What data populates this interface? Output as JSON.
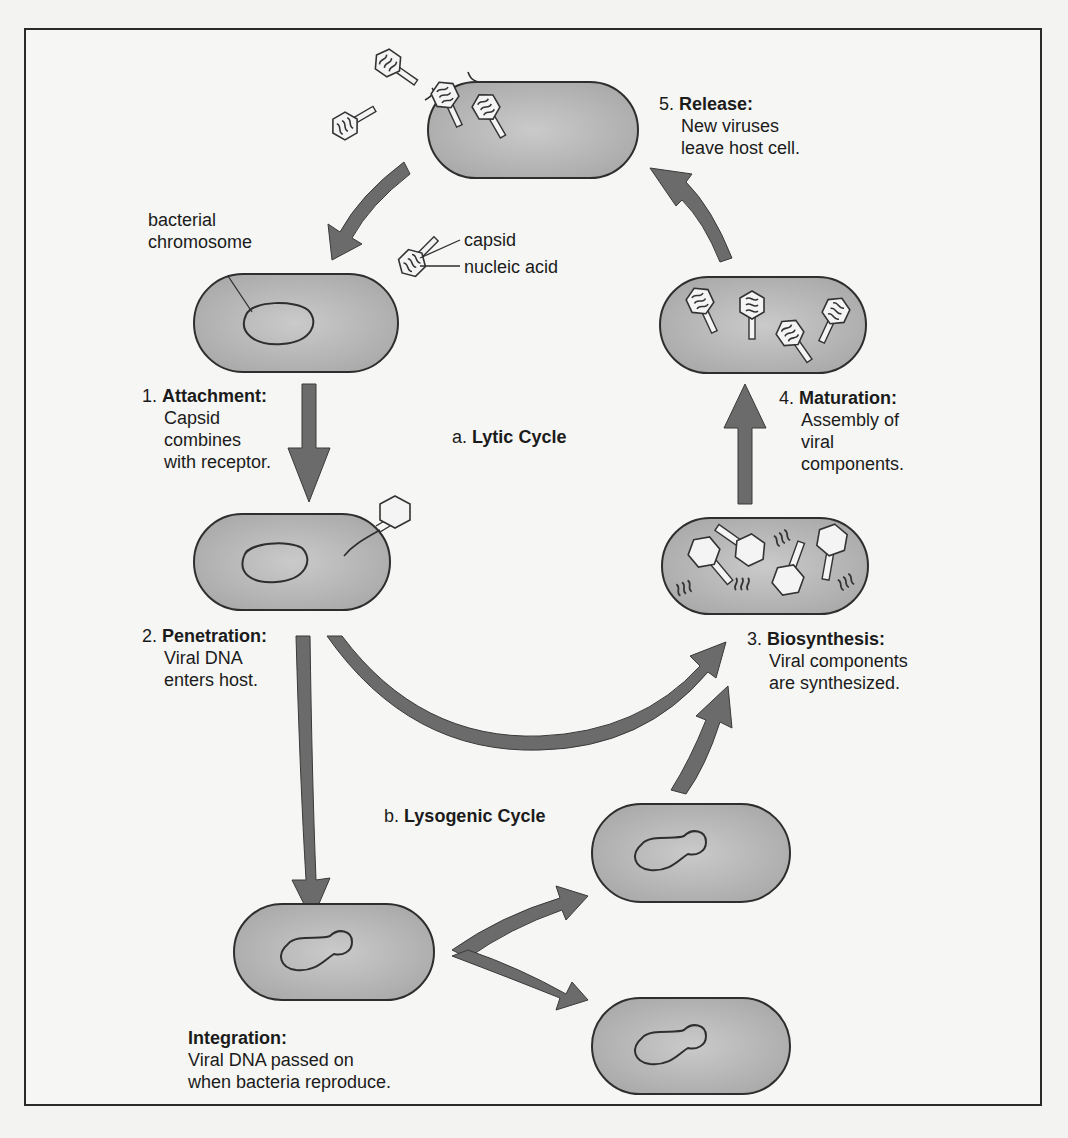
{
  "diagram": {
    "title_lytic": {
      "prefix": "a.",
      "name": "Lytic Cycle"
    },
    "title_lysogenic": {
      "prefix": "b.",
      "name": "Lysogenic Cycle"
    },
    "structure_labels": {
      "bacterial_chromosome": [
        "bacterial",
        "chromosome"
      ],
      "capsid": "capsid",
      "nucleic_acid": "nucleic acid"
    },
    "steps": [
      {
        "number": "1.",
        "title": "Attachment:",
        "lines": [
          "Capsid",
          "combines",
          "with receptor."
        ]
      },
      {
        "number": "2.",
        "title": "Penetration:",
        "lines": [
          "Viral DNA",
          "enters host."
        ]
      },
      {
        "number": "3.",
        "title": "Biosynthesis:",
        "lines": [
          "Viral components",
          "are synthesized."
        ]
      },
      {
        "number": "4.",
        "title": "Maturation:",
        "lines": [
          "Assembly of",
          "viral",
          "components."
        ]
      },
      {
        "number": "5.",
        "title": "Release:",
        "lines": [
          "New viruses",
          "leave host cell."
        ]
      }
    ],
    "integration": {
      "title": "Integration:",
      "lines": [
        "Viral DNA passed on",
        "when bacteria reproduce."
      ]
    },
    "colors": {
      "arrow": "#6b6b6b",
      "arrow_stroke": "#3a3a3a",
      "cell_fill": "#b4b4b4",
      "cell_stroke": "#2e2e2e",
      "background": "#f6f6f4"
    }
  }
}
